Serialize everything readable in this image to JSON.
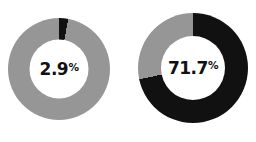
{
  "chart_data": [
    {
      "type": "pie",
      "title": "",
      "variant": "donut",
      "categories": [
        "Highlighted",
        "Remainder"
      ],
      "values": [
        2.9,
        97.1
      ],
      "center_label": "2.9",
      "center_label_suffix": "%",
      "colors": [
        "#111111",
        "#969696"
      ],
      "start_angle_deg": 0,
      "direction": "clockwise",
      "hole_ratio": 0.58,
      "legend": "none",
      "grid": false
    },
    {
      "type": "pie",
      "title": "",
      "variant": "donut",
      "categories": [
        "Highlighted",
        "Remainder"
      ],
      "values": [
        71.7,
        28.3
      ],
      "center_label": "71.7",
      "center_label_suffix": "%",
      "colors": [
        "#111111",
        "#969696"
      ],
      "start_angle_deg": 0,
      "direction": "clockwise",
      "hole_ratio": 0.58,
      "legend": "none",
      "grid": false
    }
  ],
  "charts": {
    "left": {
      "value_text": "2.9",
      "percent_symbol": "%"
    },
    "right": {
      "value_text": "71.7",
      "percent_symbol": "%"
    }
  },
  "colors": {
    "accent_dark": "#111111",
    "accent_gray": "#969696",
    "background": "#ffffff",
    "label_text": "#111111"
  }
}
